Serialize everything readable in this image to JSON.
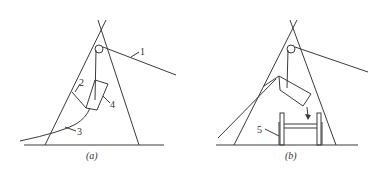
{
  "panels": [
    {
      "id": "a",
      "caption": "(a)",
      "labels": [
        {
          "text": "1",
          "part": "guy-rope"
        },
        {
          "text": "2",
          "part": "stay-line"
        },
        {
          "text": "3",
          "part": "tail-rope"
        },
        {
          "text": "4",
          "part": "lifted-component"
        }
      ]
    },
    {
      "id": "b",
      "caption": "(b)",
      "labels": [
        {
          "text": "5",
          "part": "support-frame"
        }
      ]
    }
  ],
  "colors": {
    "line": "#3a3a3a",
    "background": "#ffffff"
  }
}
